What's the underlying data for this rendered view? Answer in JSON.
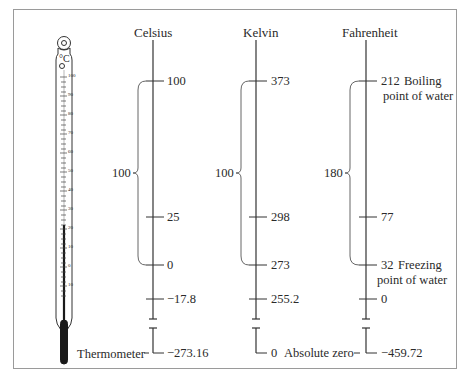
{
  "diagram": {
    "thermometer": {
      "unit_symbol": "°C",
      "scale_marks": [
        "100",
        "90",
        "80",
        "70",
        "60",
        "50",
        "40",
        "30",
        "20",
        "10",
        "0",
        "10"
      ],
      "caption": "Thermometer"
    },
    "scales": [
      {
        "name": "Celsius",
        "boiling": "100",
        "body": "25",
        "freezing": "0",
        "fahrenheit_zero": "−17.8",
        "absolute_zero": "−273.16",
        "interval": "100"
      },
      {
        "name": "Kelvin",
        "boiling": "373",
        "body": "298",
        "freezing": "273",
        "fahrenheit_zero": "255.2",
        "absolute_zero": "0",
        "interval": "100"
      },
      {
        "name": "Fahrenheit",
        "boiling": "212",
        "body": "77",
        "freezing": "32",
        "fahrenheit_zero": "0",
        "absolute_zero": "−459.72",
        "interval": "180"
      }
    ],
    "annotations": {
      "boiling_line1": "Boiling",
      "boiling_line2": "point of water",
      "freezing_line1": "Freezing",
      "freezing_line2": "point of water",
      "absolute_zero": "Absolute zero"
    }
  }
}
